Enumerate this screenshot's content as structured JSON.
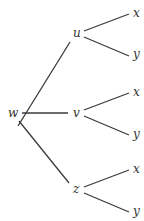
{
  "diagram": {
    "type": "tree",
    "root": {
      "id": "w",
      "label": "w"
    },
    "nodes": [
      {
        "id": "w",
        "label": "w",
        "x": 12,
        "y": 135
      },
      {
        "id": "u",
        "label": "u",
        "x": 76,
        "y": 33
      },
      {
        "id": "v",
        "label": "v",
        "x": 76,
        "y": 113
      },
      {
        "id": "z",
        "label": "z",
        "x": 76,
        "y": 189
      },
      {
        "id": "ux",
        "label": "x",
        "x": 137,
        "y": 14
      },
      {
        "id": "uy",
        "label": "y",
        "x": 137,
        "y": 56
      },
      {
        "id": "vx",
        "label": "x",
        "x": 137,
        "y": 93
      },
      {
        "id": "vy",
        "label": "y",
        "x": 137,
        "y": 136
      },
      {
        "id": "zx",
        "label": "x",
        "x": 137,
        "y": 170
      },
      {
        "id": "zy",
        "label": "y",
        "x": 137,
        "y": 213
      }
    ],
    "edges": [
      {
        "from": "w",
        "to": "u",
        "x1": 18,
        "y1": 125,
        "x2": 70,
        "y2": 42
      },
      {
        "from": "w",
        "to": "v",
        "x1": 22,
        "y1": 113,
        "x2": 68,
        "y2": 113
      },
      {
        "from": "w",
        "to": "z",
        "x1": 18,
        "y1": 121,
        "x2": 69,
        "y2": 183
      },
      {
        "from": "u",
        "to": "ux",
        "x1": 84,
        "y1": 31,
        "x2": 129,
        "y2": 14
      },
      {
        "from": "u",
        "to": "uy",
        "x1": 84,
        "y1": 37,
        "x2": 129,
        "y2": 56
      },
      {
        "from": "v",
        "to": "vx",
        "x1": 84,
        "y1": 110,
        "x2": 129,
        "y2": 93
      },
      {
        "from": "v",
        "to": "vy",
        "x1": 84,
        "y1": 116,
        "x2": 129,
        "y2": 135
      },
      {
        "from": "z",
        "to": "zx",
        "x1": 84,
        "y1": 187,
        "x2": 129,
        "y2": 170
      },
      {
        "from": "z",
        "to": "zy",
        "x1": 84,
        "y1": 193,
        "x2": 129,
        "y2": 212
      }
    ]
  },
  "labels": {
    "w": "w",
    "u": "u",
    "v": "v",
    "z": "z",
    "ux": "x",
    "uy": "y",
    "vx": "x",
    "vy": "y",
    "zx": "x",
    "zy": "y"
  }
}
